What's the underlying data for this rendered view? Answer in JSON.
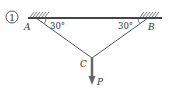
{
  "figure": {
    "number_label": "1",
    "points": {
      "A": "A",
      "B": "B",
      "C": "C"
    },
    "angles": {
      "at_A": "30°",
      "at_B": "30°"
    },
    "load_label": "P",
    "colors": {
      "stroke": "#555555",
      "text": "#333333",
      "arrow": "#666666"
    }
  }
}
